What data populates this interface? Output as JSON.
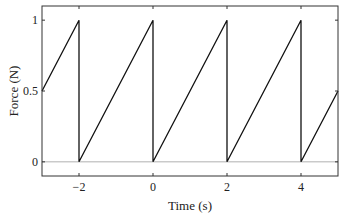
{
  "chart_data": {
    "type": "line",
    "title": "",
    "xlabel": "Time (s)",
    "ylabel": "Force (N)",
    "xlim": [
      -3,
      5
    ],
    "ylim": [
      -0.1,
      1.1
    ],
    "xticks": [
      -2,
      0,
      2,
      4
    ],
    "xtick_labels": [
      "−2",
      "0",
      "2",
      "4"
    ],
    "yticks": [
      0,
      0.5,
      1
    ],
    "ytick_labels": [
      "0",
      "0.5",
      "1"
    ],
    "grid": false,
    "legend": null,
    "reference_lines": [
      {
        "y": 0,
        "color": "#b0b0b0"
      }
    ],
    "series": [
      {
        "name": "sawtooth force",
        "color": "#111111",
        "x": [
          -3,
          -2,
          -2,
          0,
          0,
          2,
          2,
          4,
          4,
          5
        ],
        "y": [
          0.5,
          1,
          0,
          1,
          0,
          1,
          0,
          1,
          0,
          0.5
        ]
      }
    ]
  }
}
